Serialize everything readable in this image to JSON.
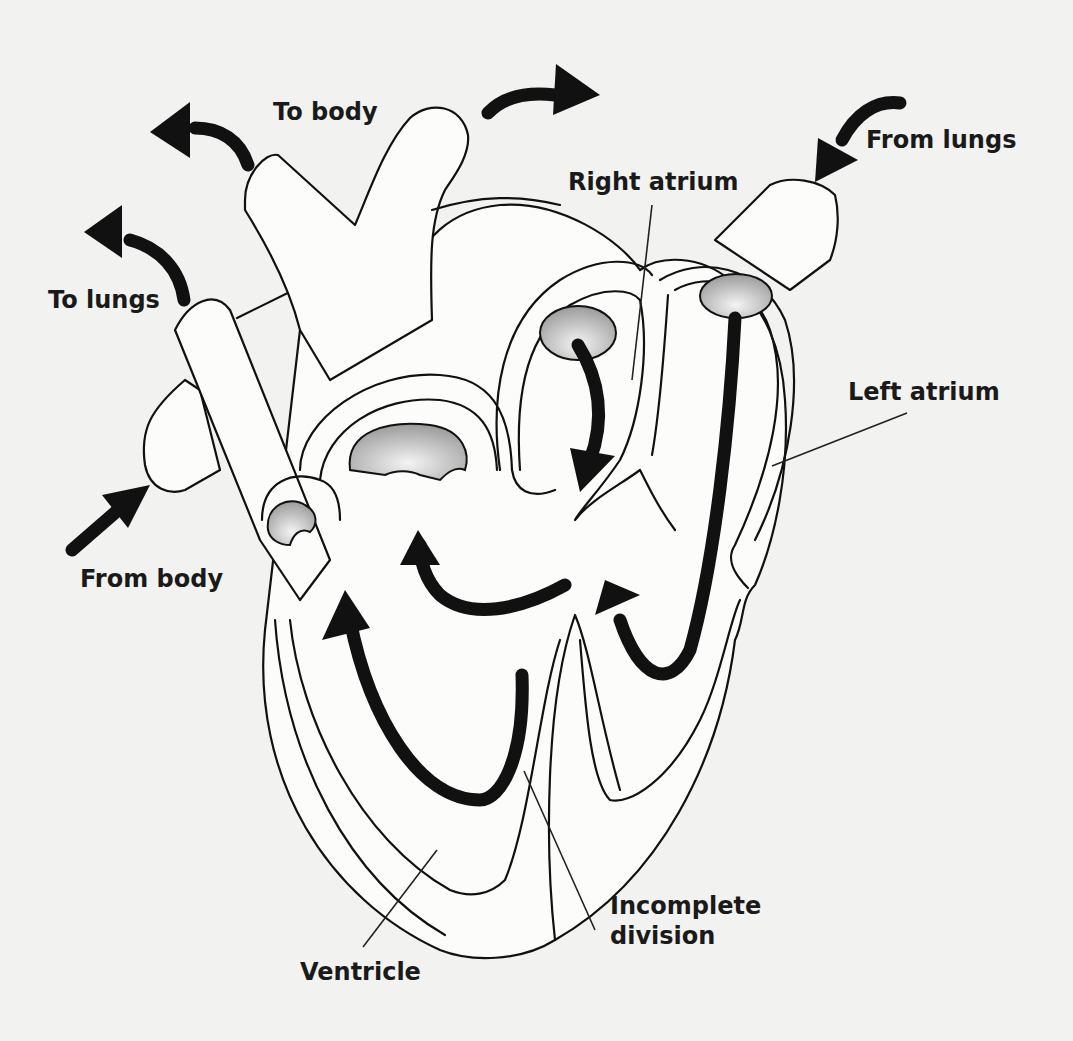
{
  "diagram": {
    "colors": {
      "background": "#f2f2f0",
      "stroke": "#111111",
      "valve_fill": "#b8b8b8"
    },
    "labels": {
      "to_body": "To body",
      "to_lungs": "To lungs",
      "from_lungs": "From lungs",
      "from_body": "From body",
      "right_atrium": "Right atrium",
      "left_atrium": "Left atrium",
      "ventricle": "Ventricle",
      "incomplete_division_line1": "Incomplete",
      "incomplete_division_line2": "division"
    },
    "arrows": [
      {
        "name": "to-body-left",
        "direction": "out"
      },
      {
        "name": "to-body-right",
        "direction": "out"
      },
      {
        "name": "to-lungs",
        "direction": "out"
      },
      {
        "name": "from-lungs",
        "direction": "in"
      },
      {
        "name": "from-body",
        "direction": "in"
      }
    ]
  }
}
